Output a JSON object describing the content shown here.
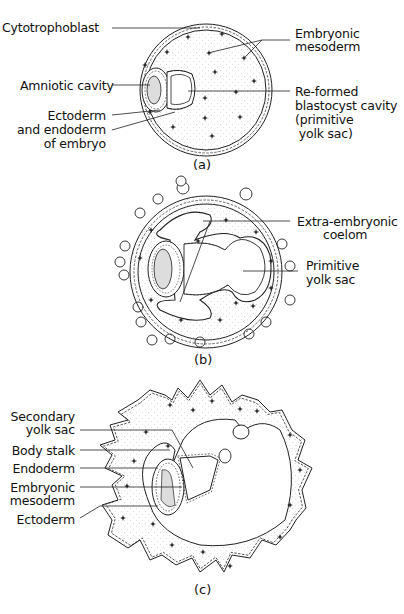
{
  "figure": {
    "panels": [
      {
        "id": "a",
        "caption": "(a)",
        "labels": {
          "cytotrophoblast": "Cytotrophoblast",
          "embryonic_mesoderm_1": "Embryonic",
          "embryonic_mesoderm_2": "mesoderm",
          "amniotic_cavity": "Amniotic cavity",
          "ecto_endo_1": "Ectoderm",
          "ecto_endo_2": "and endoderm",
          "ecto_endo_3": "of embryo",
          "reformed_1": "Re-formed",
          "reformed_2": "blastocyst cavity",
          "reformed_3": "(primitive",
          "reformed_4": " yolk sac)"
        }
      },
      {
        "id": "b",
        "caption": "(b)",
        "labels": {
          "coelom_1": "Extra-embryonic",
          "coelom_2": "coelom",
          "yolk_1": "Primitive",
          "yolk_2": "yolk sac"
        }
      },
      {
        "id": "c",
        "caption": "(c)",
        "labels": {
          "secondary_1": "Secondary",
          "secondary_2": "yolk sac",
          "body_stalk": "Body stalk",
          "endoderm": "Endoderm",
          "emb_meso_1": "Embryonic",
          "emb_meso_2": "mesoderm",
          "ectoderm": "Ectoderm"
        }
      }
    ],
    "colors": {
      "line": "#222222",
      "shade": "#d8d8d8",
      "background": "#ffffff"
    }
  }
}
